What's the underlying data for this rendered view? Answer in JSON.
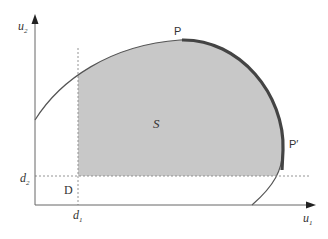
{
  "diagram": {
    "type": "bargaining-set",
    "axes": {
      "x_label": "u",
      "x_sub": "1",
      "y_label": "u",
      "y_sub": "2"
    },
    "disagreement": {
      "point_label": "D",
      "d1_label": "d",
      "d1_sub": "1",
      "d2_label": "d",
      "d2_sub": "2"
    },
    "region_label": "S",
    "pareto_start_label": "P",
    "pareto_end_label": "P′",
    "colors": {
      "fill": "#c8c8c8",
      "curve": "#555555",
      "pareto": "#444444",
      "axis": "#666666",
      "dashed": "#888888"
    }
  }
}
